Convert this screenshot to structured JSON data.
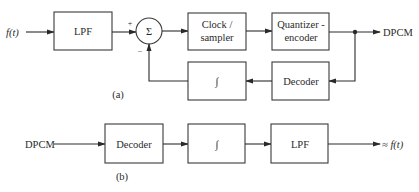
{
  "diagram": {
    "part_a": {
      "caption": "(a)",
      "input_label": "f(t)",
      "output_label": "DPCM",
      "blocks": {
        "lpf": "LPF",
        "summer_symbol": "Σ",
        "summer_plus": "+",
        "summer_minus": "−",
        "clock_line1": "Clock /",
        "clock_line2": "sampler",
        "quantizer_line1": "Quantizer -",
        "quantizer_line2": "encoder",
        "integrator": "∫",
        "decoder": "Decoder"
      }
    },
    "part_b": {
      "caption": "(b)",
      "input_label": "DPCM",
      "output_label": "≈ f(t)",
      "blocks": {
        "decoder": "Decoder",
        "integrator": "∫",
        "lpf": "LPF"
      }
    },
    "colors": {
      "line": "#2a2a2a",
      "background": "#ffffff"
    }
  }
}
